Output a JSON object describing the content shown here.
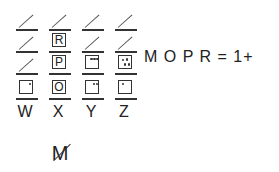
{
  "grid": {
    "columns": [
      "W",
      "X",
      "Y",
      "Z"
    ],
    "rows": [
      [
        "slash",
        "slash",
        "slash",
        "slash"
      ],
      [
        "slash",
        "box:R",
        "slash",
        "slash"
      ],
      [
        "slash",
        "box:P",
        "box:3dots",
        "box:4dots"
      ],
      [
        "box:1dot",
        "box:O",
        "box:2dots",
        "box:1dot"
      ]
    ],
    "letters": {
      "x_row2": "R",
      "x_row3": "P",
      "x_row4": "O"
    }
  },
  "equation": "M O P R = 1+",
  "struck_letter": "M",
  "icons": {
    "slash": "diagonal-stroke-icon",
    "strike": "strikethrough-icon"
  }
}
